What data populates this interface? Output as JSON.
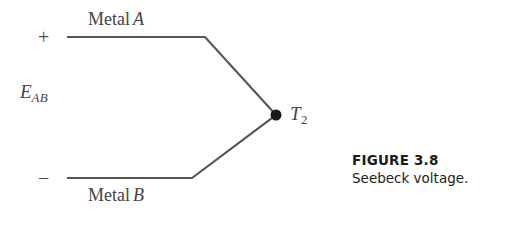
{
  "figure": {
    "caption_title": "FIGURE 3.8",
    "caption_text": "Seebeck voltage.",
    "background_color": "#ffffff",
    "line_color": "#555555",
    "text_color": "#444444"
  },
  "diagram": {
    "polarity": {
      "positive": "+",
      "negative": "−"
    },
    "voltage": {
      "symbol": "E",
      "subscript": "AB"
    },
    "conductors": [
      {
        "name": "Metal A",
        "prefix": "Metal",
        "id": "A",
        "polarity": "+",
        "start_x": 68,
        "start_y": 37,
        "bend_x": 205,
        "bend_y": 37
      },
      {
        "name": "Metal B",
        "prefix": "Metal",
        "id": "B",
        "polarity": "−",
        "start_x": 68,
        "start_y": 178,
        "bend_x": 192,
        "bend_y": 178
      }
    ],
    "junction": {
      "symbol": "T",
      "subscript": "2",
      "x": 276,
      "y": 115,
      "dot_radius": 5.5
    }
  }
}
